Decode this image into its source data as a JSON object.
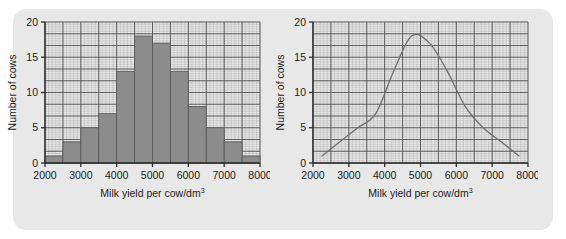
{
  "figure": {
    "panel_background": "#e8e8e8",
    "page_background": "#ffffff",
    "bar_fill": "#8c8c8c",
    "bar_stroke": "#5a5a5a",
    "grid_minor_color": "#b9b9b9",
    "grid_major_color": "#4a4a4a",
    "axis_color": "#2b2b2b",
    "curve_color": "#6e6e6e"
  },
  "chart_data": [
    {
      "type": "bar",
      "title": "",
      "subtitle": "",
      "xlabel": "Milk yield per cow/dm",
      "xlabel_sup": "3",
      "ylabel": "Number of cows",
      "xlim": [
        2000,
        8000
      ],
      "ylim": [
        0,
        20
      ],
      "grid": true,
      "legend": "none",
      "bin_width": 500,
      "xticks": [
        2000,
        3000,
        4000,
        5000,
        6000,
        7000,
        8000
      ],
      "xtick_labels": [
        "2000",
        "3000",
        "4000",
        "5000",
        "6000",
        "7000",
        "8000"
      ],
      "yticks": [
        0,
        5,
        10,
        15,
        20
      ],
      "ytick_labels": [
        "0",
        "5",
        "10",
        "15",
        "20"
      ],
      "bins": [
        {
          "lo": 2000,
          "hi": 2500,
          "value": 1
        },
        {
          "lo": 2500,
          "hi": 3000,
          "value": 3
        },
        {
          "lo": 3000,
          "hi": 3500,
          "value": 5
        },
        {
          "lo": 3500,
          "hi": 4000,
          "value": 7
        },
        {
          "lo": 4000,
          "hi": 4500,
          "value": 13
        },
        {
          "lo": 4500,
          "hi": 5000,
          "value": 18
        },
        {
          "lo": 5000,
          "hi": 5500,
          "value": 17
        },
        {
          "lo": 5500,
          "hi": 6000,
          "value": 13
        },
        {
          "lo": 6000,
          "hi": 6500,
          "value": 8
        },
        {
          "lo": 6500,
          "hi": 7000,
          "value": 5
        },
        {
          "lo": 7000,
          "hi": 7500,
          "value": 3
        },
        {
          "lo": 7500,
          "hi": 8000,
          "value": 1
        }
      ],
      "categories": [
        "2000-2500",
        "2500-3000",
        "3000-3500",
        "3500-4000",
        "4000-4500",
        "4500-5000",
        "5000-5500",
        "5500-6000",
        "6000-6500",
        "6500-7000",
        "7000-7500",
        "7500-8000"
      ],
      "values": [
        1,
        3,
        5,
        7,
        13,
        18,
        17,
        13,
        8,
        5,
        3,
        1
      ]
    },
    {
      "type": "line",
      "title": "",
      "subtitle": "",
      "xlabel": "Milk yield per cow/dm",
      "xlabel_sup": "3",
      "ylabel": "Number of cows",
      "xlim": [
        2000,
        8000
      ],
      "ylim": [
        0,
        20
      ],
      "grid": true,
      "legend": "none",
      "xticks": [
        2000,
        3000,
        4000,
        5000,
        6000,
        7000,
        8000
      ],
      "xtick_labels": [
        "2000",
        "3000",
        "4000",
        "5000",
        "6000",
        "7000",
        "8000"
      ],
      "yticks": [
        0,
        5,
        10,
        15,
        20
      ],
      "ytick_labels": [
        "0",
        "5",
        "10",
        "15",
        "20"
      ],
      "series": [
        {
          "name": "frequency polygon",
          "x": [
            2250,
            2750,
            3250,
            3750,
            4250,
            4750,
            5250,
            5750,
            6250,
            6750,
            7250,
            7750
          ],
          "y": [
            1,
            3,
            5,
            7,
            13,
            18,
            17,
            13,
            8,
            5,
            3,
            1
          ]
        }
      ]
    }
  ]
}
